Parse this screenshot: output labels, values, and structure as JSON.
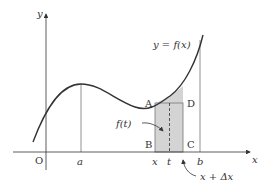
{
  "diagram": {
    "type": "calculus-area-under-curve",
    "axes": {
      "x_label": "x",
      "y_label": "y",
      "origin_label": "O"
    },
    "curve_label": "y = f(x)",
    "ticks": {
      "a": "a",
      "x": "x",
      "t": "t",
      "b": "b"
    },
    "points": {
      "A": "A",
      "B": "B",
      "C": "C",
      "D": "D"
    },
    "annotations": {
      "ft_label": "f(t)",
      "x_plus_dx_label": "x + Δx"
    },
    "colors": {
      "stroke": "#333333",
      "shade": "#d4d4d4",
      "guide": "#777777"
    }
  }
}
